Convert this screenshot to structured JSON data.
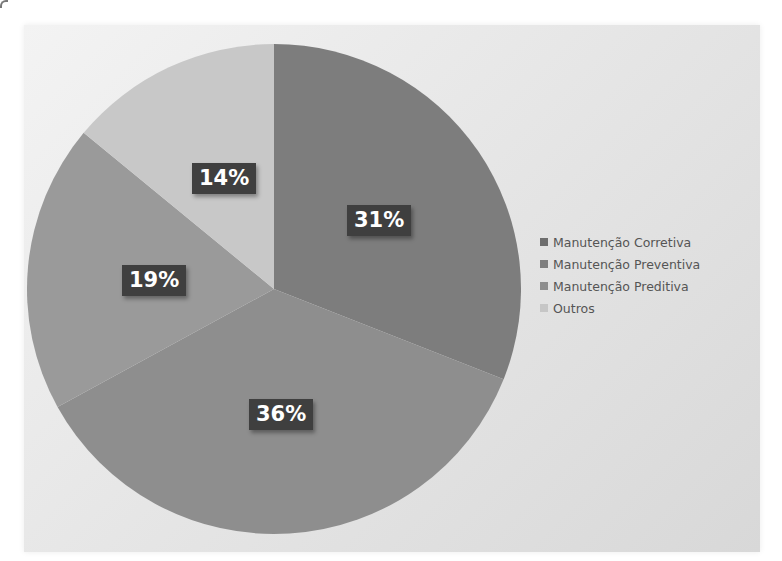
{
  "chart_data": {
    "type": "pie",
    "title": "",
    "categories": [
      "Manutenção Corretiva",
      "Manutenção Preventiva",
      "Manutenção Preditiva",
      "Outros"
    ],
    "values": [
      31,
      36,
      19,
      14
    ],
    "unit": "%",
    "data_labels": [
      "31%",
      "36%",
      "19%",
      "14%"
    ],
    "colors": [
      "#7d7d7d",
      "#8e8e8e",
      "#9a9a9a",
      "#c8c8c8"
    ],
    "start_angle_deg": 0,
    "direction": "clockwise",
    "legend_position": "right"
  },
  "legend": {
    "items": [
      {
        "label": "Manutenção Corretiva",
        "color": "#6e6e6e"
      },
      {
        "label": "Manutenção Preventiva",
        "color": "#7e7e7e"
      },
      {
        "label": "Manutenção Preditiva",
        "color": "#8e8e8e"
      },
      {
        "label": "Outros",
        "color": "#c6c6c6"
      }
    ]
  },
  "labels": {
    "corretiva": "31%",
    "preventiva": "36%",
    "preditiva": "19%",
    "outros": "14%"
  }
}
